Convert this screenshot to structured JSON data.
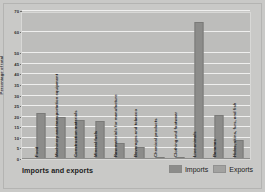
{
  "chart_data": {
    "type": "bar",
    "title": "Imports and exports",
    "xlabel": "",
    "ylabel": "Percentage of total",
    "ylim": [
      0,
      70
    ],
    "grid": true,
    "legend_position": "bottom-right",
    "yticks": [
      0,
      5,
      10,
      15,
      20,
      25,
      30,
      35,
      40,
      45,
      50,
      60,
      70
    ],
    "ytick_labels": [
      "0",
      "5",
      "10",
      "15",
      "20",
      "25",
      "30",
      "35",
      "40",
      "45",
      "50",
      "60",
      "70"
    ],
    "categories": [
      "Food",
      "Machinery and transportation equipment",
      "Construction materials",
      "Mineral fuels",
      "Raw materials for manufacture",
      "Beverages and tobacco",
      "Chemical products",
      "Clothing and footwear",
      "Live animals",
      "Bananas",
      "Hides, skins, furs, and fish"
    ],
    "series": [
      {
        "name": "Imports",
        "color": "#8c8c8a",
        "values": [
          22,
          20,
          18.5,
          18,
          7.5,
          5.5,
          1,
          1,
          null,
          null,
          null
        ]
      },
      {
        "name": "Exports",
        "color": "#8c8c8a",
        "values": [
          null,
          null,
          null,
          null,
          null,
          null,
          null,
          null,
          65,
          21,
          9
        ]
      }
    ],
    "bars": [
      {
        "category": "Food",
        "value": 22,
        "series": "Imports"
      },
      {
        "category": "Machinery and transportation equipment",
        "value": 20,
        "series": "Imports"
      },
      {
        "category": "Construction materials",
        "value": 18.5,
        "series": "Imports"
      },
      {
        "category": "Mineral fuels",
        "value": 18,
        "series": "Imports"
      },
      {
        "category": "Raw materials for manufacture",
        "value": 7.5,
        "series": "Imports"
      },
      {
        "category": "Beverages and tobacco",
        "value": 5.5,
        "series": "Imports"
      },
      {
        "category": "Chemical products",
        "value": 1,
        "series": "Imports"
      },
      {
        "category": "Clothing and footwear",
        "value": 1,
        "series": "Imports"
      },
      {
        "category": "Live animals",
        "value": 65,
        "series": "Exports"
      },
      {
        "category": "Bananas",
        "value": 21,
        "series": "Exports"
      },
      {
        "category": "Hides, skins, furs, and fish",
        "value": 9,
        "series": "Exports"
      }
    ]
  },
  "legend": {
    "items": [
      {
        "label": "Imports",
        "color": "#8c8c8a"
      },
      {
        "label": "Exports",
        "color": "#a2a2a0"
      }
    ]
  }
}
